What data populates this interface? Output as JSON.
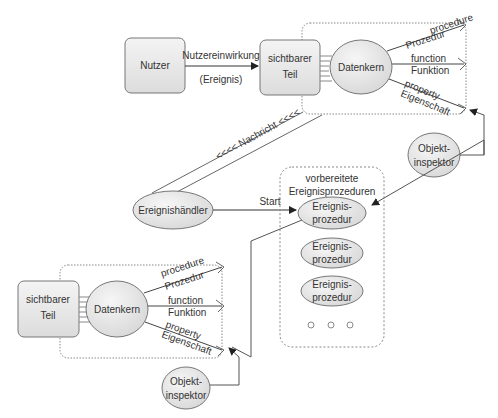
{
  "top": {
    "user_box": "Nutzer",
    "input_label": "Nutzereinwirkung",
    "event_label": "(Ereignis)",
    "visible_part": [
      "sichtbarer",
      "Teil"
    ],
    "data_core": "Datenkern",
    "procedure": [
      "procedure",
      "Prozedur"
    ],
    "function": [
      "function",
      "Funktion"
    ],
    "property": [
      "property",
      "Eigenschaft"
    ],
    "inspector": [
      "Objekt-",
      "inspektor"
    ]
  },
  "message_label": "<<<< Nachricht <<<<",
  "handler": "Ereignishändler",
  "start_label": "Start",
  "prepared": {
    "title": [
      "vorbereitete",
      "Ereignisprozeduren"
    ],
    "items": [
      [
        "Ereignis-",
        "prozedur"
      ],
      [
        "Ereignis-",
        "prozedur"
      ],
      [
        "Ereignis-",
        "prozedur"
      ]
    ],
    "more": "○  ○  ○"
  },
  "bottom": {
    "visible_part": [
      "sichtbarer",
      "Teil"
    ],
    "data_core": "Datenkern",
    "procedure": [
      "procedure",
      "Prozedur"
    ],
    "function": [
      "function",
      "Funktion"
    ],
    "property": [
      "property",
      "Eigenschaft"
    ],
    "inspector": [
      "Objekt-",
      "inspektor"
    ]
  },
  "colors": {
    "stroke": "#555555",
    "fill_box": "#e6e6e6",
    "fill_ellipse": "#e8e8e8",
    "dotted": "#888888"
  }
}
